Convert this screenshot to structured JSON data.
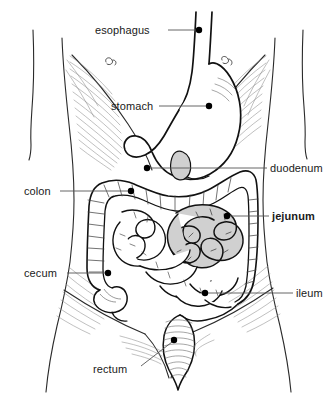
{
  "figure": {
    "background_color": "#ffffff",
    "line_color": "#1a1a1a",
    "highlight_fill": "#d0d0d0",
    "leader_color": "#555555",
    "dot_color": "#000000",
    "width": 336,
    "height": 411
  },
  "labels": [
    {
      "id": "esophagus",
      "text": "esophagus",
      "bold": false,
      "text_x": 95,
      "text_y": 25,
      "anchor": "end",
      "leader_from_x": 168,
      "leader_from_y": 30,
      "leader_to_x": 196,
      "leader_to_y": 30,
      "dot_x": 199,
      "dot_y": 30
    },
    {
      "id": "stomach",
      "text": "stomach",
      "bold": false,
      "text_x": 111,
      "text_y": 101,
      "anchor": "end",
      "leader_from_x": 159,
      "leader_from_y": 106,
      "leader_to_x": 206,
      "leader_to_y": 106,
      "dot_x": 209,
      "dot_y": 106
    },
    {
      "id": "duodenum",
      "text": "duodenum",
      "bold": false,
      "text_x": 270,
      "text_y": 163,
      "anchor": "start",
      "leader_from_x": 150,
      "leader_from_y": 168,
      "leader_to_x": 267,
      "leader_to_y": 168,
      "dot_x": 147,
      "dot_y": 168
    },
    {
      "id": "colon",
      "text": "colon",
      "bold": false,
      "text_x": 24,
      "text_y": 186,
      "anchor": "end",
      "leader_from_x": 60,
      "leader_from_y": 191,
      "leader_to_x": 128,
      "leader_to_y": 191,
      "dot_x": 131,
      "dot_y": 191
    },
    {
      "id": "jejunum",
      "text": "jejunum",
      "bold": true,
      "text_x": 272,
      "text_y": 211,
      "anchor": "start",
      "leader_from_x": 230,
      "leader_from_y": 216,
      "leader_to_x": 269,
      "leader_to_y": 216,
      "dot_x": 227,
      "dot_y": 216
    },
    {
      "id": "cecum",
      "text": "cecum",
      "bold": false,
      "text_x": 24,
      "text_y": 268,
      "anchor": "end",
      "leader_from_x": 67,
      "leader_from_y": 273,
      "leader_to_x": 105,
      "leader_to_y": 273,
      "dot_x": 108,
      "dot_y": 273
    },
    {
      "id": "ileum",
      "text": "ileum",
      "bold": false,
      "text_x": 296,
      "text_y": 288,
      "anchor": "start",
      "leader_from_x": 208,
      "leader_from_y": 293,
      "leader_to_x": 293,
      "leader_to_y": 293,
      "dot_x": 205,
      "dot_y": 293
    },
    {
      "id": "rectum",
      "text": "rectum",
      "bold": false,
      "text_x": 93,
      "text_y": 364,
      "anchor": "end",
      "leader_from_x": 141,
      "leader_from_y": 366,
      "leader_to_x": 172,
      "leader_to_y": 342,
      "dot_x": 174,
      "dot_y": 340
    }
  ],
  "organs": [
    {
      "id": "esophagus",
      "name": "esophagus",
      "shaded": false
    },
    {
      "id": "stomach",
      "name": "stomach",
      "shaded": false
    },
    {
      "id": "duodenum",
      "name": "duodenum",
      "shaded": true
    },
    {
      "id": "colon",
      "name": "colon",
      "shaded": false
    },
    {
      "id": "jejunum",
      "name": "jejunum",
      "shaded": true
    },
    {
      "id": "cecum",
      "name": "cecum",
      "shaded": false
    },
    {
      "id": "ileum",
      "name": "ileum",
      "shaded": false
    },
    {
      "id": "rectum",
      "name": "rectum",
      "shaded": false
    }
  ]
}
